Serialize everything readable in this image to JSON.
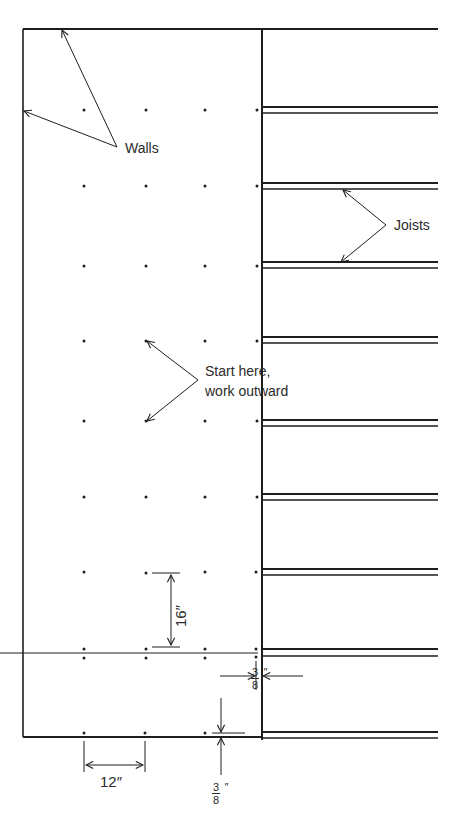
{
  "labels": {
    "walls": "Walls",
    "joists": "Joists",
    "start_line1": "Start here,",
    "start_line2": "work outward",
    "dim_vertical": "16″",
    "dim_horizontal": "12″",
    "gap_right_num": "3",
    "gap_right_den": "8",
    "gap_right_unit": "″",
    "gap_bottom_num": "3",
    "gap_bottom_den": "8",
    "gap_bottom_unit": "″"
  },
  "colors": {
    "line": "#1e1e1e",
    "text": "#2a2a2a",
    "background": "#ffffff"
  },
  "geometry": {
    "nail_columns_x": [
      84,
      146,
      205,
      257
    ],
    "nail_rows_y": [
      110,
      186,
      267,
      341,
      421,
      497,
      572,
      649,
      658,
      733
    ],
    "joist_pairs_y": [
      107,
      185,
      263,
      337,
      420,
      495,
      570,
      650,
      734
    ]
  }
}
